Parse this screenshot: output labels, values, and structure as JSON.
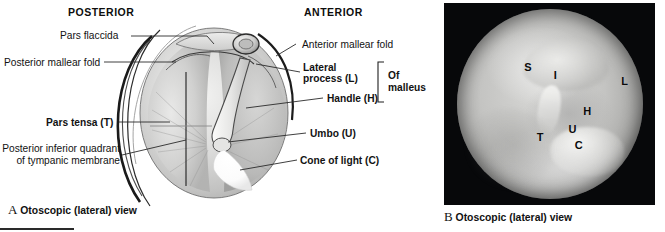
{
  "panel_a": {
    "orientation": {
      "posterior": "POSTERIOR",
      "anterior": "ANTERIOR"
    },
    "labels": {
      "pars_flaccida": "Pars flaccida",
      "posterior_mallear_fold": "Posterior mallear fold",
      "pars_tensa": "Pars tensa (T)",
      "posterior_inferior_quadrant": "Posterior inferior quadrant of tympanic membrane",
      "anterior_mallear_fold": "Anterior mallear fold",
      "lateral_process": "Lateral process (L)",
      "handle": "Handle (H)",
      "of_malleus": "Of malleus",
      "umbo": "Umbo (U)",
      "cone_of_light": "Cone of light (C)"
    },
    "caption_letter": "A",
    "caption_text": "Otoscopic (lateral) view"
  },
  "panel_b": {
    "caption_letter": "B",
    "caption_text": "Otoscopic (lateral) view",
    "markers": [
      {
        "letter": "S",
        "left": "38%",
        "top": "29%"
      },
      {
        "letter": "I",
        "left": "52%",
        "top": "33%"
      },
      {
        "letter": "L",
        "left": "84%",
        "top": "36%"
      },
      {
        "letter": "H",
        "left": "66%",
        "top": "51%"
      },
      {
        "letter": "U",
        "left": "59%",
        "top": "60%"
      },
      {
        "letter": "T",
        "left": "44%",
        "top": "64%"
      },
      {
        "letter": "C",
        "left": "62%",
        "top": "68%"
      }
    ]
  },
  "colors": {
    "background": "#ffffff",
    "text": "#111111",
    "photo_background": "#07080a",
    "leader_line": "#2a2a2a"
  }
}
